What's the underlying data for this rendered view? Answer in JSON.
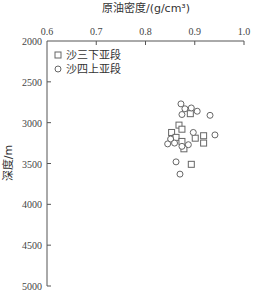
{
  "chart_data": {
    "type": "scatter",
    "title": "",
    "xlabel": "原油密度/(g/cm³)",
    "ylabel": "深度/m",
    "x_axis_position": "top",
    "y_axis_inverted": true,
    "xlim": [
      0.6,
      1.0
    ],
    "ylim": [
      2000,
      5000
    ],
    "x_ticks": [
      "0.6",
      "0.7",
      "0.8",
      "0.9",
      "1.0"
    ],
    "y_ticks": [
      "2000",
      "2500",
      "3000",
      "3500",
      "4000",
      "4500",
      "5000"
    ],
    "grid": false,
    "legend_position": "top-left",
    "series": [
      {
        "name": "沙三下亚段",
        "marker": "square",
        "points": [
          {
            "x": 0.891,
            "y": 2890
          },
          {
            "x": 0.868,
            "y": 3030
          },
          {
            "x": 0.874,
            "y": 3080
          },
          {
            "x": 0.853,
            "y": 3120
          },
          {
            "x": 0.862,
            "y": 3180
          },
          {
            "x": 0.874,
            "y": 3230
          },
          {
            "x": 0.918,
            "y": 3160
          },
          {
            "x": 0.918,
            "y": 3250
          },
          {
            "x": 0.901,
            "y": 3190
          },
          {
            "x": 0.878,
            "y": 3320
          },
          {
            "x": 0.893,
            "y": 3510
          }
        ]
      },
      {
        "name": "沙四上亚段",
        "marker": "circle",
        "points": [
          {
            "x": 0.872,
            "y": 2770
          },
          {
            "x": 0.88,
            "y": 2830
          },
          {
            "x": 0.893,
            "y": 2820
          },
          {
            "x": 0.905,
            "y": 2860
          },
          {
            "x": 0.874,
            "y": 2900
          },
          {
            "x": 0.931,
            "y": 2910
          },
          {
            "x": 0.897,
            "y": 3120
          },
          {
            "x": 0.851,
            "y": 3200
          },
          {
            "x": 0.845,
            "y": 3260
          },
          {
            "x": 0.859,
            "y": 3250
          },
          {
            "x": 0.887,
            "y": 3270
          },
          {
            "x": 0.941,
            "y": 3150
          },
          {
            "x": 0.874,
            "y": 3290
          },
          {
            "x": 0.862,
            "y": 3480
          },
          {
            "x": 0.87,
            "y": 3630
          }
        ]
      }
    ]
  }
}
